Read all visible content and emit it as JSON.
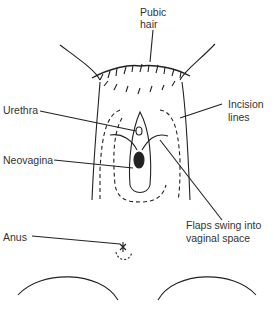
{
  "labels": {
    "pubic_hair_1": "Pubic",
    "pubic_hair_2": "hair",
    "urethra": "Urethra",
    "incision_1": "Incision",
    "incision_2": "lines",
    "neovagina": "Neovagina",
    "flaps_1": "Flaps swing into",
    "flaps_2": "vaginal space",
    "anus": "Anus"
  }
}
